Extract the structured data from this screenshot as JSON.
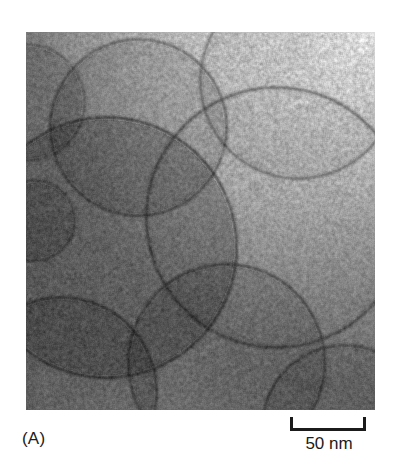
{
  "figure": {
    "panel_label": "(A)",
    "scale_bar": {
      "label": "50 nm",
      "value": 50,
      "unit": "nm",
      "bar_length_px": 76,
      "style": "u-bracket"
    },
    "micrograph": {
      "modality": "transmission-electron-microscopy",
      "subject": "lipid vesicles / liposomes",
      "background_color": "#8f8f8f",
      "membrane_color": "#2e2e2e",
      "bright_corner": "top-right",
      "grain": "high",
      "region": {
        "x": 26,
        "y": 32,
        "width": 349,
        "height": 378
      },
      "vesicles": [
        {
          "cx": 0,
          "cy": 70,
          "r": 58,
          "fill": 0.86,
          "ring": 0.8
        },
        {
          "cx": 112,
          "cy": 95,
          "r": 88,
          "fill": 0.88,
          "ring": 0.72
        },
        {
          "cx": 272,
          "cy": 48,
          "r": 98,
          "fill": 0.94,
          "ring": 0.75
        },
        {
          "cx": 250,
          "cy": 185,
          "r": 130,
          "fill": 0.97,
          "ring": 0.7
        },
        {
          "cx": 80,
          "cy": 215,
          "r": 130,
          "fill": 0.8,
          "ring": 0.66
        },
        {
          "cx": 200,
          "cy": 330,
          "r": 98,
          "fill": 0.88,
          "ring": 0.7
        },
        {
          "cx": 35,
          "cy": 360,
          "r": 95,
          "fill": 0.84,
          "ring": 0.68
        },
        {
          "cx": 318,
          "cy": 395,
          "r": 82,
          "fill": 0.92,
          "ring": 0.72
        },
        {
          "cx": 8,
          "cy": 188,
          "r": 40,
          "fill": 0.85,
          "ring": 0.74
        }
      ]
    }
  }
}
